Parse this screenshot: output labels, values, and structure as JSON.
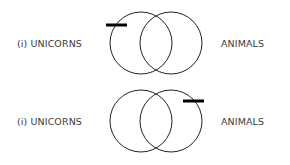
{
  "diagrams": [
    {
      "left_label": "(i) UNICORNS",
      "right_label": "ANIMALS",
      "shaded_mark": "left-circle-outer"
    },
    {
      "left_label": "(i) UNICORNS",
      "right_label": "ANIMALS",
      "shaded_mark": "right-circle-outer"
    }
  ],
  "colors": {
    "stroke": "#222222",
    "bar": "#000000",
    "text": "#3a3a3a"
  }
}
